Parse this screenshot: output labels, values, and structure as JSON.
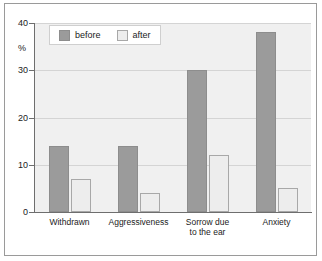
{
  "chart_data": {
    "type": "bar",
    "title": "",
    "subtitle": "",
    "xlabel": "",
    "ylabel": "%",
    "ylim": [
      0,
      40
    ],
    "yticks": [
      0,
      10,
      20,
      30,
      40
    ],
    "ytick_labels": [
      "0",
      "10",
      "20",
      "30",
      "40"
    ],
    "grid": true,
    "grid_axis": "y",
    "legend_position": "top-left-inside",
    "categories": [
      "Withdrawn",
      "Aggressiveness",
      "Sorrow due\nto the ear",
      "Anxiety"
    ],
    "series": [
      {
        "name": "before",
        "color": "#9b9b9b",
        "values": [
          14,
          14,
          30,
          38
        ]
      },
      {
        "name": "after",
        "color": "#ededed",
        "values": [
          7,
          4,
          12,
          5
        ]
      }
    ]
  },
  "legend": {
    "items": [
      {
        "label": "before",
        "swatch": "legend-swatch-before"
      },
      {
        "label": "after",
        "swatch": "legend-swatch-after"
      }
    ]
  },
  "colors": {
    "before_fill": "#9b9b9b",
    "before_border": "#8d8d8d",
    "after_fill": "#ededed",
    "after_border": "#a8a8a8",
    "plot_background": "#f0f0f0",
    "gridline": "#d4d4d4",
    "axis": "#6e6e6e",
    "frame": "#9a9a9a",
    "text": "#1b1b1b",
    "page_background": "#ffffff"
  }
}
